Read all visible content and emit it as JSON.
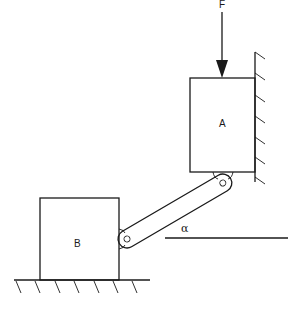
{
  "diagram": {
    "force_label": "F",
    "block_a_label": "A",
    "block_b_label": "B",
    "angle_label": "α",
    "elements": {
      "force": "vertical downward arrow acting on top of block A",
      "block_a": "block sliding along vertical wall",
      "block_b": "block sliding along horizontal ground",
      "link": "rigid link pinned between block A bottom-left and block B right side",
      "wall": "fixed vertical wall with hatching, right of block A",
      "ground": "fixed horizontal ground with hatching, under block B",
      "reference_line": "horizontal reference line for angle α"
    }
  }
}
